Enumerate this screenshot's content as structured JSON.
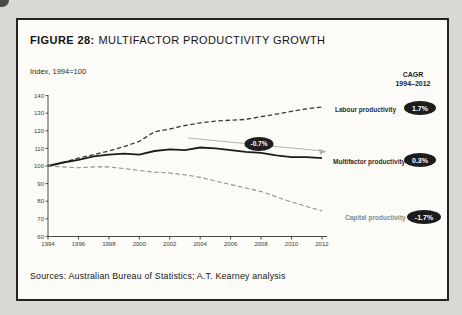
{
  "figure": {
    "title_label": "FIGURE 28:",
    "title_text": "MULTIFACTOR PRODUCTIVITY GROWTH",
    "axis_note": "Index, 1994=100",
    "cagr_header_line1": "CAGR",
    "cagr_header_line2": "1994–2012",
    "sources": "Sources: Australian Bureau of Statistics; A.T. Kearney analysis"
  },
  "chart_data": {
    "type": "line",
    "ylabel": "Index, 1994=100",
    "xlabel": "",
    "grid": false,
    "legend_position": "right-of-lines",
    "ylim": [
      60,
      140
    ],
    "yticks": [
      60,
      70,
      80,
      90,
      100,
      110,
      120,
      130,
      140
    ],
    "xticks": [
      1994,
      1996,
      1998,
      2000,
      2002,
      2004,
      2006,
      2008,
      2010,
      2012
    ],
    "x": [
      1994,
      1995,
      1996,
      1997,
      1998,
      1999,
      2000,
      2001,
      2002,
      2003,
      2004,
      2005,
      2006,
      2007,
      2008,
      2009,
      2010,
      2011,
      2012
    ],
    "series": [
      {
        "name": "Labour productivity",
        "cagr": "1.7%",
        "style": "dashed",
        "color": "#3c3c3c",
        "values": [
          100,
          102,
          104.5,
          106.5,
          108.5,
          111,
          114,
          119.5,
          121,
          123,
          124.5,
          125.5,
          126,
          126.5,
          128,
          129.5,
          131,
          132.5,
          133.5
        ]
      },
      {
        "name": "Multifactor productivity",
        "cagr": "0.3%",
        "style": "solid",
        "color": "#1c1c1c",
        "values": [
          100,
          102,
          103.5,
          105.5,
          106.5,
          107,
          106.5,
          108.5,
          109.5,
          109,
          110.5,
          110,
          109,
          108,
          107.5,
          106,
          105,
          105,
          104.5
        ]
      },
      {
        "name": "Capital productivity",
        "cagr": "-1.7%",
        "style": "dashed-light",
        "color": "#8f8f8d",
        "values": [
          100,
          99.5,
          99,
          99.5,
          99.5,
          98.5,
          97.5,
          96.5,
          96,
          95,
          93.5,
          91.5,
          89.5,
          87.5,
          85.5,
          82.5,
          79.5,
          77,
          74.5
        ]
      }
    ],
    "annotation": {
      "label": "-0.7%",
      "meaning": "trend of multifactor productivity over arrow span"
    }
  }
}
